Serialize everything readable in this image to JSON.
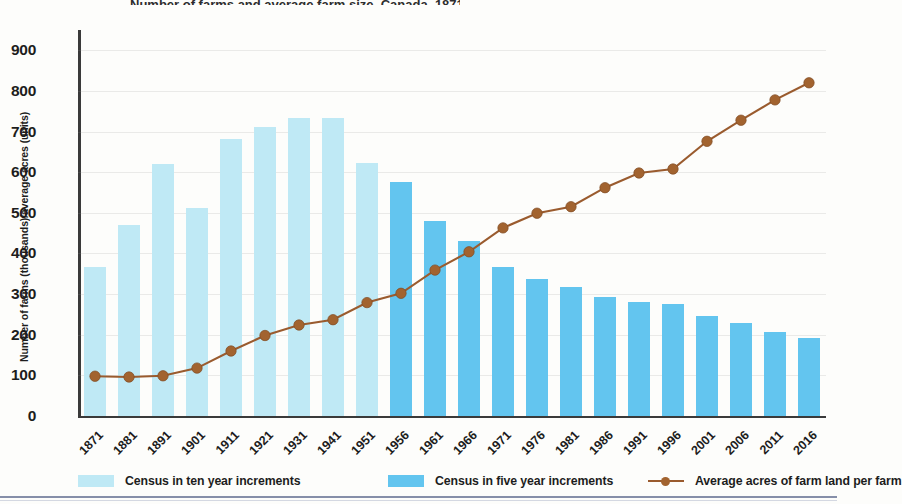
{
  "title_sliver": "Number of farms and average farm size, Canada, 1871 to 2016",
  "axis": {
    "ylabel": "Number of farms (thousands)/average acres (units)",
    "yticks": [
      0,
      100,
      200,
      300,
      400,
      500,
      600,
      700,
      800,
      900
    ],
    "ylim": [
      0,
      950
    ]
  },
  "legend": {
    "items": [
      {
        "label": "Census in ten year increments",
        "type": "swatch",
        "color": "#bfe9f5"
      },
      {
        "label": "Census in five year increments",
        "type": "swatch",
        "color": "#63c5ef"
      },
      {
        "label": "Average acres of farm land per farm",
        "type": "line",
        "color": "#9a5b2e"
      }
    ]
  },
  "chart_data": {
    "type": "bar",
    "title": "Number of farms and average farm size, Canada, 1871 to 2016",
    "xlabel": "",
    "ylabel": "Number of farms (thousands)/average acres (units)",
    "ylim": [
      0,
      950
    ],
    "grid": true,
    "legend_position": "bottom",
    "categories": [
      "1871",
      "1881",
      "1891",
      "1901",
      "1911",
      "1921",
      "1931",
      "1941",
      "1951",
      "1956",
      "1961",
      "1966",
      "1971",
      "1976",
      "1981",
      "1986",
      "1991",
      "1996",
      "2001",
      "2006",
      "2011",
      "2016"
    ],
    "series": [
      {
        "name": "Census in ten year increments",
        "type": "bar",
        "color": "#bfe9f5",
        "values": [
          367,
          470,
          620,
          512,
          682,
          711,
          733,
          733,
          623,
          null,
          null,
          null,
          null,
          null,
          null,
          null,
          null,
          null,
          null,
          null,
          null,
          null
        ]
      },
      {
        "name": "Census in five year increments",
        "type": "bar",
        "color": "#63c5ef",
        "values": [
          null,
          null,
          null,
          null,
          null,
          null,
          null,
          null,
          null,
          575,
          481,
          430,
          366,
          338,
          318,
          293,
          281,
          276,
          247,
          229,
          206,
          193
        ]
      },
      {
        "name": "Average acres of farm land per farm",
        "type": "line",
        "color": "#9a5b2e",
        "values": [
          98,
          96,
          99,
          118,
          160,
          198,
          224,
          237,
          279,
          302,
          359,
          404,
          463,
          499,
          515,
          562,
          598,
          608,
          676,
          728,
          778,
          820
        ]
      }
    ]
  }
}
